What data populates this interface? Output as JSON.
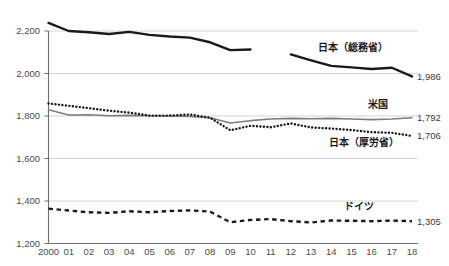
{
  "chart_data": {
    "type": "line",
    "title": "",
    "subtitle": "",
    "xlabel": "",
    "ylabel": "",
    "ylim": [
      1200,
      2200
    ],
    "xlim": [
      2000,
      2018
    ],
    "grid": true,
    "gridlines": [
      1200,
      1400,
      1600,
      1800,
      2000,
      2200
    ],
    "legend_position": "inline-right",
    "yticks": [
      "1,200",
      "1,400",
      "1,600",
      "1,800",
      "2,000",
      "2,200"
    ],
    "ytick_values": [
      1200,
      1400,
      1600,
      1800,
      2000,
      2200
    ],
    "categories": [
      2000,
      2001,
      2002,
      2003,
      2004,
      2005,
      2006,
      2007,
      2008,
      2009,
      2010,
      2011,
      2012,
      2013,
      2014,
      2015,
      2016,
      2017,
      2018
    ],
    "xticks": [
      "2000",
      "01",
      "02",
      "03",
      "04",
      "05",
      "06",
      "07",
      "08",
      "09",
      "10",
      "11",
      "12",
      "13",
      "14",
      "15",
      "16",
      "17",
      "18"
    ],
    "series": [
      {
        "name": "日本（総務省）",
        "label": "日本（総務省）",
        "style": "solid",
        "color": "#1a1a1a",
        "width": 2.4,
        "end_value": 1986,
        "end_value_label": "1,986",
        "label_x": 2015.1,
        "label_y": 2105,
        "segments": [
          {
            "x": [
              2000,
              2001,
              2002,
              2003,
              2004,
              2005,
              2006,
              2007,
              2008,
              2009,
              2010
            ],
            "values": [
              2238,
              2200,
              2194,
              2186,
              2196,
              2182,
              2174,
              2169,
              2147,
              2110,
              2113
            ]
          },
          {
            "x": [
              2012,
              2013,
              2014,
              2015,
              2016,
              2017,
              2018
            ],
            "values": [
              2090,
              2062,
              2036,
              2029,
              2021,
              2027,
              1986
            ]
          }
        ]
      },
      {
        "name": "米国",
        "label": "米国",
        "style": "solid",
        "color": "#7d7d7d",
        "width": 1.6,
        "end_value": 1792,
        "end_value_label": "1,792",
        "label_x": 2016.3,
        "label_y": 1838,
        "segments": [
          {
            "x": [
              2000,
              2001,
              2002,
              2003,
              2004,
              2005,
              2006,
              2007,
              2008,
              2009,
              2010,
              2011,
              2012,
              2013,
              2014,
              2015,
              2016,
              2017,
              2018
            ],
            "values": [
              1829,
              1805,
              1806,
              1801,
              1803,
              1801,
              1800,
              1798,
              1792,
              1767,
              1778,
              1786,
              1789,
              1787,
              1789,
              1786,
              1783,
              1786,
              1792
            ]
          }
        ]
      },
      {
        "name": "日本（厚労省）",
        "label": "日本（厚労省）",
        "style": "dotted",
        "color": "#1a1a1a",
        "width": 2.4,
        "end_value": 1706,
        "end_value_label": "1,706",
        "label_x": 2015.6,
        "label_y": 1660,
        "segments": [
          {
            "x": [
              2000,
              2001,
              2002,
              2003,
              2004,
              2005,
              2006,
              2007,
              2008,
              2009,
              2010,
              2011,
              2012,
              2013,
              2014,
              2015,
              2016,
              2017,
              2018
            ],
            "values": [
              1859,
              1848,
              1837,
              1825,
              1816,
              1802,
              1802,
              1807,
              1792,
              1733,
              1754,
              1747,
              1765,
              1746,
              1741,
              1734,
              1724,
              1721,
              1706
            ]
          }
        ]
      },
      {
        "name": "ドイツ",
        "label": "ドイツ",
        "style": "dashed",
        "color": "#1a1a1a",
        "width": 2.4,
        "end_value": 1305,
        "end_value_label": "1,305",
        "label_x": 2015.4,
        "label_y": 1360,
        "segments": [
          {
            "x": [
              2000,
              2001,
              2002,
              2003,
              2004,
              2005,
              2006,
              2007,
              2008,
              2009,
              2010,
              2011,
              2012,
              2013,
              2014,
              2015,
              2016,
              2017,
              2018
            ],
            "values": [
              1364,
              1355,
              1347,
              1344,
              1352,
              1347,
              1353,
              1356,
              1350,
              1300,
              1311,
              1315,
              1305,
              1299,
              1308,
              1307,
              1305,
              1308,
              1305
            ]
          }
        ]
      }
    ]
  }
}
